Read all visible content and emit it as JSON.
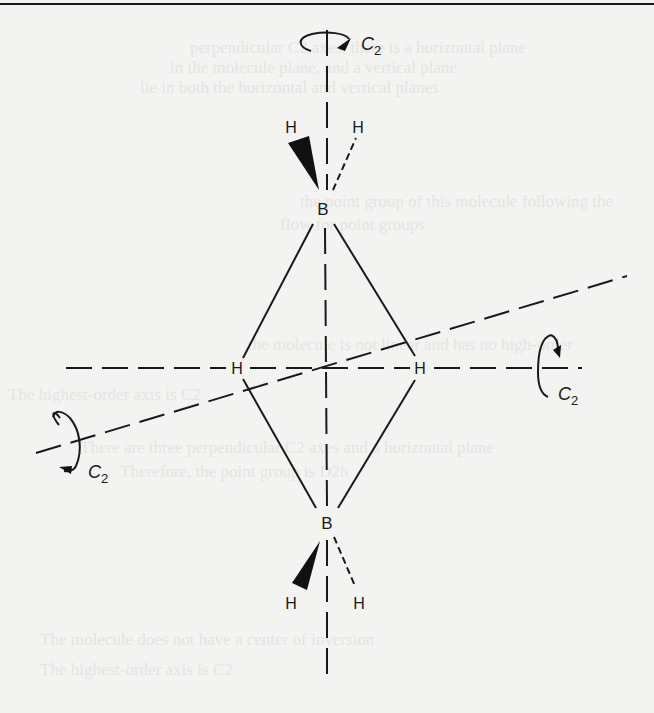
{
  "figure": {
    "molecule": "B2H6",
    "atoms": {
      "boron_top": "B",
      "boron_bottom": "B",
      "h_bridge_left": "H",
      "h_bridge_right": "H",
      "h_top_left": "H",
      "h_top_right": "H",
      "h_bottom_left": "H",
      "h_bottom_right": "H"
    },
    "axes": [
      {
        "id": "vertical",
        "label": "C",
        "subscript": "2"
      },
      {
        "id": "horizontal",
        "label": "C",
        "subscript": "2"
      },
      {
        "id": "diagonal",
        "label": "C",
        "subscript": "2"
      }
    ]
  },
  "show_through_text": [
    "perpendicular C2 axes, there is a horizontal plane",
    "in the molecule plane, and a vertical plane",
    "lie in both the horizontal and vertical planes",
    "the point group of this molecule following the",
    "flow for point groups",
    "the molecule is not linear and has no high-order",
    "The highest-order axis is C2",
    "There are three perpendicular C2 axes and a horizontal plane",
    "Therefore, the point group is D2h",
    "The molecule does not have a center of inversion",
    "The highest-order axis is C2"
  ]
}
